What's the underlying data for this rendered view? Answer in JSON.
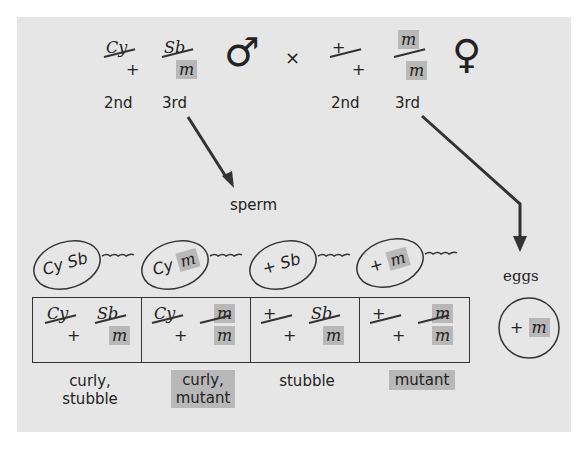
{
  "parents": {
    "male": {
      "chr2": {
        "top": "Cy",
        "bottom": "+"
      },
      "chr3": {
        "top": "Sb",
        "bottom": "m",
        "bottom_highlight": true
      },
      "symbol": "♂",
      "labels": [
        "2nd",
        "3rd"
      ]
    },
    "cross_symbol": "×",
    "female": {
      "chr2": {
        "top": "+",
        "bottom": "+"
      },
      "chr3": {
        "top": "m",
        "bottom": "m",
        "top_highlight": true,
        "bottom_highlight": true
      },
      "symbol": "♀",
      "labels": [
        "2nd",
        "3rd"
      ]
    }
  },
  "gamete_labels": {
    "sperm": "sperm",
    "eggs": "eggs"
  },
  "sperm": [
    {
      "a": "Cy",
      "b": "Sb",
      "b_highlight": false
    },
    {
      "a": "Cy",
      "b": "m",
      "b_highlight": true
    },
    {
      "a": "+",
      "b": "Sb",
      "b_highlight": false
    },
    {
      "a": "+",
      "b": "m",
      "b_highlight": true
    }
  ],
  "egg": {
    "a": "+",
    "b": "m",
    "b_highlight": true
  },
  "offspring": [
    {
      "chr2_top": "Cy",
      "chr2_bot": "+",
      "chr3_top": "Sb",
      "chr3_bot": "m",
      "phenotype_line1": "curly,",
      "phenotype_line2": "stubble",
      "highlight": false
    },
    {
      "chr2_top": "Cy",
      "chr2_bot": "+",
      "chr3_top": "m",
      "chr3_bot": "m",
      "phenotype_line1": "curly,",
      "phenotype_line2": "mutant",
      "highlight": true
    },
    {
      "chr2_top": "+",
      "chr2_bot": "+",
      "chr3_top": "Sb",
      "chr3_bot": "m",
      "phenotype_line1": "stubble",
      "phenotype_line2": "",
      "highlight": false
    },
    {
      "chr2_top": "+",
      "chr2_bot": "+",
      "chr3_top": "m",
      "chr3_bot": "m",
      "phenotype_line1": "mutant",
      "phenotype_line2": "",
      "highlight": true
    }
  ],
  "colors": {
    "panel": "#e6e6e6",
    "highlight": "#b8b8b8",
    "ink": "#222222"
  }
}
